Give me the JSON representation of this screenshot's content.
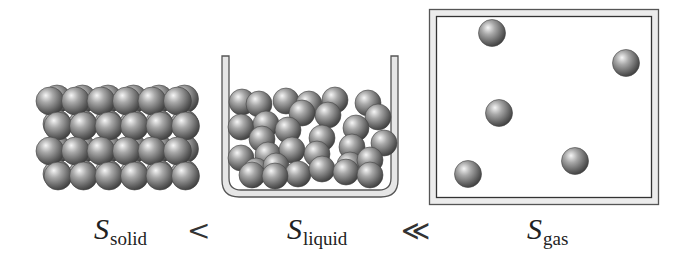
{
  "figure": {
    "panels": [
      {
        "id": "solid",
        "label_symbol": "S",
        "label_subscript": "solid",
        "lattice": {
          "rows": 4,
          "cols": 6,
          "x0": 50,
          "y0": 101,
          "dx": 25.5,
          "dy": 25,
          "r": 14
        }
      },
      {
        "id": "liquid",
        "label_symbol": "S",
        "label_subscript": "liquid",
        "spheres": [
          [
            242,
            102
          ],
          [
            259,
            104
          ],
          [
            286,
            101
          ],
          [
            309,
            104
          ],
          [
            335,
            100
          ],
          [
            368,
            103
          ],
          [
            302,
            113
          ],
          [
            328,
            115
          ],
          [
            378,
            117
          ],
          [
            241,
            127
          ],
          [
            266,
            124
          ],
          [
            288,
            130
          ],
          [
            322,
            138
          ],
          [
            356,
            128
          ],
          [
            262,
            139
          ],
          [
            352,
            147
          ],
          [
            384,
            143
          ],
          [
            241,
            158
          ],
          [
            268,
            155
          ],
          [
            292,
            150
          ],
          [
            317,
            154
          ],
          [
            350,
            165
          ],
          [
            370,
            160
          ],
          [
            256,
            171
          ],
          [
            276,
            166
          ],
          [
            298,
            174
          ],
          [
            322,
            169
          ],
          [
            346,
            172
          ],
          [
            370,
            175
          ],
          [
            252,
            175
          ],
          [
            275,
            176
          ]
        ],
        "r": 13
      },
      {
        "id": "gas",
        "label_symbol": "S",
        "label_subscript": "gas",
        "spheres": [
          [
            492,
            33
          ],
          [
            626,
            63
          ],
          [
            499,
            113
          ],
          [
            575,
            161
          ],
          [
            468,
            174
          ]
        ],
        "r": 13.5
      }
    ],
    "relations": [
      "<",
      "≪"
    ]
  },
  "colors": {
    "sphere_light": "#f4f4f4",
    "sphere_mid": "#8a8a8a",
    "sphere_dark": "#3a3a3a",
    "container_stroke": "#555555",
    "container_fill": "#e8e8e8"
  }
}
